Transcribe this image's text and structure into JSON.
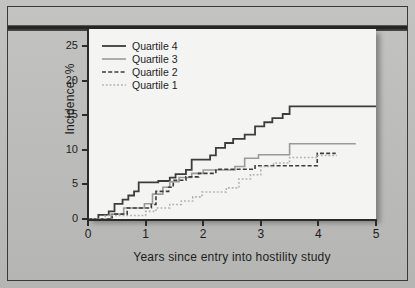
{
  "chart_data": {
    "type": "line",
    "title": "",
    "xlabel": "Years since entry into hostility study",
    "ylabel": "Incidence, %",
    "xlim": [
      0,
      5
    ],
    "ylim": [
      0,
      27.5
    ],
    "xticks": [
      "0",
      "1",
      "2",
      "3",
      "4",
      "5"
    ],
    "yticks": [
      "0",
      "5",
      "10",
      "15",
      "20",
      "25"
    ],
    "grid": false,
    "legend_position": "top-left",
    "step_style": "post",
    "series": [
      {
        "name": "Quartile 4",
        "style": "solid",
        "color": "#3c3c3c",
        "width": 1.8,
        "points": [
          [
            0.0,
            0.0
          ],
          [
            0.18,
            0.0
          ],
          [
            0.18,
            0.6
          ],
          [
            0.36,
            0.6
          ],
          [
            0.36,
            1.1
          ],
          [
            0.46,
            1.1
          ],
          [
            0.46,
            2.2
          ],
          [
            0.6,
            2.2
          ],
          [
            0.6,
            2.8
          ],
          [
            0.7,
            2.8
          ],
          [
            0.7,
            3.4
          ],
          [
            0.8,
            3.4
          ],
          [
            0.8,
            4.0
          ],
          [
            0.88,
            4.0
          ],
          [
            0.88,
            5.3
          ],
          [
            1.22,
            5.3
          ],
          [
            1.22,
            5.5
          ],
          [
            1.42,
            5.5
          ],
          [
            1.42,
            6.0
          ],
          [
            1.52,
            6.0
          ],
          [
            1.52,
            6.5
          ],
          [
            1.7,
            6.5
          ],
          [
            1.7,
            7.1
          ],
          [
            1.8,
            7.1
          ],
          [
            1.8,
            8.6
          ],
          [
            2.12,
            8.6
          ],
          [
            2.12,
            9.2
          ],
          [
            2.22,
            9.2
          ],
          [
            2.22,
            10.3
          ],
          [
            2.38,
            10.3
          ],
          [
            2.38,
            11.0
          ],
          [
            2.52,
            11.0
          ],
          [
            2.52,
            11.6
          ],
          [
            2.72,
            11.6
          ],
          [
            2.72,
            12.2
          ],
          [
            2.9,
            12.2
          ],
          [
            2.9,
            13.4
          ],
          [
            3.06,
            13.4
          ],
          [
            3.06,
            14.0
          ],
          [
            3.2,
            14.0
          ],
          [
            3.2,
            14.6
          ],
          [
            3.38,
            14.6
          ],
          [
            3.38,
            15.2
          ],
          [
            3.5,
            15.2
          ],
          [
            3.5,
            16.3
          ],
          [
            5.0,
            16.3
          ]
        ]
      },
      {
        "name": "Quartile 3",
        "style": "solid",
        "color": "#9a9a9a",
        "width": 1.6,
        "points": [
          [
            0.0,
            0.0
          ],
          [
            0.4,
            0.0
          ],
          [
            0.4,
            0.7
          ],
          [
            0.62,
            0.7
          ],
          [
            0.62,
            1.6
          ],
          [
            0.98,
            1.6
          ],
          [
            0.98,
            2.2
          ],
          [
            1.12,
            2.2
          ],
          [
            1.12,
            3.6
          ],
          [
            1.3,
            3.6
          ],
          [
            1.3,
            4.6
          ],
          [
            1.42,
            4.6
          ],
          [
            1.42,
            5.4
          ],
          [
            1.58,
            5.4
          ],
          [
            1.58,
            6.0
          ],
          [
            1.8,
            6.0
          ],
          [
            1.8,
            6.6
          ],
          [
            2.0,
            6.6
          ],
          [
            2.0,
            7.1
          ],
          [
            2.55,
            7.1
          ],
          [
            2.55,
            7.6
          ],
          [
            2.72,
            7.6
          ],
          [
            2.72,
            8.8
          ],
          [
            2.96,
            8.8
          ],
          [
            2.96,
            9.3
          ],
          [
            3.5,
            9.3
          ],
          [
            3.5,
            10.9
          ],
          [
            4.65,
            10.9
          ]
        ]
      },
      {
        "name": "Quartile 2",
        "style": "dashed",
        "color": "#3c3c3c",
        "width": 1.6,
        "points": [
          [
            0.0,
            0.0
          ],
          [
            0.42,
            0.0
          ],
          [
            0.42,
            0.7
          ],
          [
            0.68,
            0.7
          ],
          [
            0.68,
            1.6
          ],
          [
            1.1,
            1.6
          ],
          [
            1.1,
            2.1
          ],
          [
            1.18,
            2.1
          ],
          [
            1.18,
            4.0
          ],
          [
            1.4,
            4.0
          ],
          [
            1.4,
            4.6
          ],
          [
            1.48,
            4.6
          ],
          [
            1.48,
            5.6
          ],
          [
            1.7,
            5.6
          ],
          [
            1.7,
            6.1
          ],
          [
            1.92,
            6.1
          ],
          [
            1.92,
            6.6
          ],
          [
            2.22,
            6.6
          ],
          [
            2.22,
            7.2
          ],
          [
            2.9,
            7.2
          ],
          [
            2.9,
            7.7
          ],
          [
            3.98,
            7.7
          ],
          [
            3.98,
            9.5
          ],
          [
            4.3,
            9.5
          ]
        ]
      },
      {
        "name": "Quartile 1",
        "style": "dotted",
        "color": "#b0b0b0",
        "width": 1.6,
        "points": [
          [
            0.0,
            0.0
          ],
          [
            0.3,
            0.0
          ],
          [
            0.3,
            0.5
          ],
          [
            1.0,
            0.5
          ],
          [
            1.0,
            1.1
          ],
          [
            1.18,
            1.1
          ],
          [
            1.18,
            1.6
          ],
          [
            1.42,
            1.6
          ],
          [
            1.42,
            2.1
          ],
          [
            1.62,
            2.1
          ],
          [
            1.62,
            2.6
          ],
          [
            1.82,
            2.6
          ],
          [
            1.82,
            3.2
          ],
          [
            1.98,
            3.2
          ],
          [
            1.98,
            3.9
          ],
          [
            2.4,
            3.9
          ],
          [
            2.4,
            4.5
          ],
          [
            2.62,
            4.5
          ],
          [
            2.62,
            5.8
          ],
          [
            2.82,
            5.8
          ],
          [
            2.82,
            6.4
          ],
          [
            3.0,
            6.4
          ],
          [
            3.0,
            7.6
          ],
          [
            3.22,
            7.6
          ],
          [
            3.22,
            8.1
          ],
          [
            3.5,
            8.1
          ],
          [
            3.5,
            8.9
          ],
          [
            3.98,
            8.9
          ],
          [
            3.98,
            9.2
          ],
          [
            4.32,
            9.2
          ]
        ]
      }
    ]
  },
  "legend": {
    "items": [
      {
        "label": "Quartile 4"
      },
      {
        "label": "Quartile 3"
      },
      {
        "label": "Quartile 2"
      },
      {
        "label": "Quartile 1"
      }
    ]
  },
  "colors": {
    "quartile4": "#3c3c3c",
    "quartile3": "#9a9a9a",
    "quartile2": "#3c3c3c",
    "quartile1": "#b0b0b0",
    "background": "#bdbdbb",
    "panel": "#f4f4f2",
    "axis": "#2b2b2b"
  }
}
